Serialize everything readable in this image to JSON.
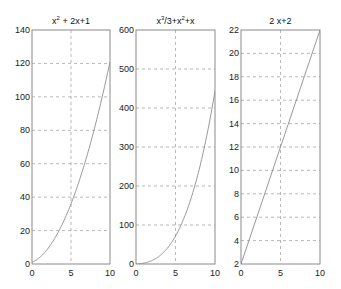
{
  "chart_data": [
    {
      "type": "line",
      "title": "x^2 + 2x+1",
      "title_parts": {
        "base": "x",
        "sup": "2",
        "rest": " + 2x+1"
      },
      "xlabel": "",
      "ylabel": "",
      "xlim": [
        0,
        10
      ],
      "ylim": [
        0,
        140
      ],
      "xticks": [
        0,
        5,
        10
      ],
      "yticks": [
        0,
        20,
        40,
        60,
        80,
        100,
        120,
        140
      ],
      "grid": true,
      "x": [
        0,
        1,
        2,
        3,
        4,
        5,
        6,
        7,
        8,
        9,
        10
      ],
      "values": [
        1,
        4,
        9,
        16,
        25,
        36,
        49,
        64,
        81,
        100,
        121
      ]
    },
    {
      "type": "line",
      "title": "x^3/3+x^2+x",
      "title_parts": {
        "base": "x",
        "sup": "3",
        "mid": "/3+x",
        "sup2": "2",
        "rest": "+x"
      },
      "xlabel": "",
      "ylabel": "",
      "xlim": [
        0,
        10
      ],
      "ylim": [
        0,
        600
      ],
      "xticks": [
        0,
        5,
        10
      ],
      "yticks": [
        0,
        100,
        200,
        300,
        400,
        500,
        600
      ],
      "grid": true,
      "x": [
        0,
        1,
        2,
        3,
        4,
        5,
        6,
        7,
        8,
        9,
        10
      ],
      "values": [
        0,
        2.33,
        8.67,
        21,
        41.33,
        71.67,
        114,
        170.33,
        242.67,
        333,
        443.33
      ]
    },
    {
      "type": "line",
      "title": "2 x+2",
      "xlabel": "",
      "ylabel": "",
      "xlim": [
        0,
        10
      ],
      "ylim": [
        2,
        22
      ],
      "xticks": [
        0,
        5,
        10
      ],
      "yticks": [
        2,
        4,
        6,
        8,
        10,
        12,
        14,
        16,
        18,
        20,
        22
      ],
      "grid": true,
      "x": [
        0,
        10
      ],
      "values": [
        2,
        22
      ]
    }
  ],
  "layout": {
    "axes": [
      {
        "left": 32,
        "top": 30,
        "width": 78,
        "height": 234
      },
      {
        "left": 136,
        "top": 30,
        "width": 79,
        "height": 234
      },
      {
        "left": 241,
        "top": 30,
        "width": 79,
        "height": 234
      }
    ],
    "colors": {
      "frame": "#8a8a8a",
      "grid": "#9a9a9a",
      "curve": "#8c8c8c",
      "background": "#ffffff"
    }
  }
}
